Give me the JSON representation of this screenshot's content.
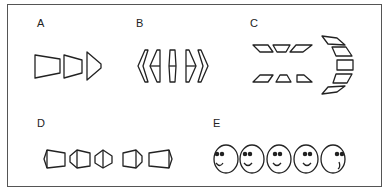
{
  "panels": [
    {
      "id": "A",
      "label": "A",
      "description": "three trapezoids shrinking to a point, facing right"
    },
    {
      "id": "B",
      "label": "B",
      "description": "five chevron-like shapes rotating from left-pointing to right-pointing"
    },
    {
      "id": "C",
      "label": "C",
      "description": "two rows of three parallelograms plus an arc of five shapes"
    },
    {
      "id": "D",
      "label": "D",
      "description": "five hexagonal/trapezoidal prisms rotating in view"
    },
    {
      "id": "E",
      "label": "E",
      "description": "five smiley faces with eyes and mouth shifting right"
    }
  ],
  "colors": {
    "stroke": "#222222",
    "border": "#555555",
    "background": "#ffffff"
  }
}
